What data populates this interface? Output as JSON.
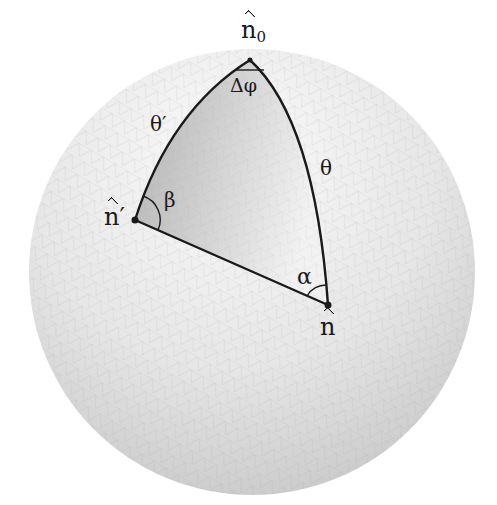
{
  "figure": {
    "colors": {
      "background": "#ffffff",
      "sphere_light": "#f4f4f4",
      "sphere_dark": "#c8c8c8",
      "triangle_dark": "#b4b4b4",
      "triangle_light": "#ececec",
      "stroke": "#1a1a1a"
    },
    "vertices": {
      "n0": {
        "label_base": "n",
        "label_sub": "0",
        "x": 250,
        "y": 60
      },
      "n_prime": {
        "label_base": "n",
        "label_prime": "′",
        "x": 135,
        "y": 220
      },
      "n": {
        "label_base": "n",
        "x": 328,
        "y": 305
      }
    },
    "edges": {
      "theta_prime": {
        "label": "θ′",
        "from": "n0",
        "to": "n_prime"
      },
      "theta": {
        "label": "θ",
        "from": "n0",
        "to": "n"
      },
      "base": {
        "label": "",
        "from": "n_prime",
        "to": "n"
      }
    },
    "angles": {
      "delta_phi": {
        "label": "Δφ",
        "at": "n0"
      },
      "beta": {
        "label": "β",
        "at": "n_prime"
      },
      "alpha": {
        "label": "α",
        "at": "n"
      }
    }
  }
}
